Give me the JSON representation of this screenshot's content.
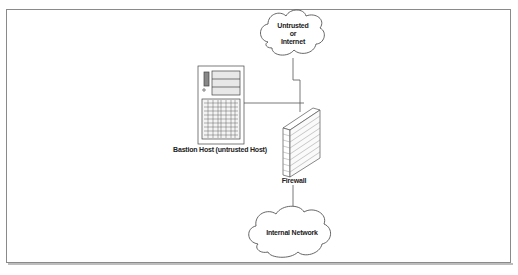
{
  "diagram": {
    "nodes": [
      {
        "id": "internet",
        "type": "cloud",
        "label_lines": [
          "Untrusted",
          "or",
          "Internet"
        ]
      },
      {
        "id": "bastion",
        "type": "server",
        "label": "Bastion Host (untrusted Host)"
      },
      {
        "id": "firewall",
        "type": "firewall",
        "label": "Firewall"
      },
      {
        "id": "internal",
        "type": "cloud",
        "label": "Internal Network"
      }
    ],
    "edges": [
      {
        "from": "internet",
        "to": "firewall"
      },
      {
        "from": "bastion",
        "to": "firewall"
      },
      {
        "from": "firewall",
        "to": "internal"
      }
    ],
    "colors": {
      "line": "#555555",
      "frame": "#8a8a8a",
      "brick": "#777777"
    }
  }
}
